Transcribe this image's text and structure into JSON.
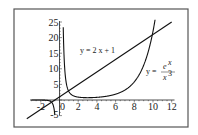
{
  "chart_data": {
    "type": "line",
    "title": "",
    "xlabel": "",
    "ylabel": "",
    "xlim": [
      -3,
      12
    ],
    "ylim": [
      -5,
      25
    ],
    "grid": false,
    "x_ticks": [
      -2,
      0,
      2,
      4,
      6,
      8,
      10,
      12
    ],
    "y_ticks": [
      -5,
      5,
      10,
      15,
      20,
      25
    ],
    "x_tick_labels": [
      "-2",
      "0",
      "2",
      "4",
      "6",
      "8",
      "10",
      "12"
    ],
    "y_tick_labels": [
      "-5",
      "5",
      "10",
      "15",
      "20",
      "25"
    ],
    "series": [
      {
        "name": "y = 2x + 1",
        "function": "2*x+1",
        "x": [
          -3,
          0,
          12
        ],
        "y": [
          -5,
          1,
          25
        ]
      },
      {
        "name": "y = e^x / x^3",
        "function": "exp(x)/x^3",
        "x": [
          -1,
          0.6,
          1,
          2,
          3,
          4,
          5,
          6,
          7,
          8,
          9,
          10
        ],
        "y": [
          -0.37,
          8.5,
          2.72,
          0.92,
          0.74,
          0.85,
          1.19,
          1.87,
          3.2,
          5.82,
          11.1,
          22.0
        ]
      }
    ],
    "annotations": [
      {
        "text": "y = 2 x + 1",
        "x": 5,
        "y": 17
      },
      {
        "text": "y = e^x / x^3",
        "x": 11,
        "y": 7
      }
    ],
    "intersections": [
      {
        "x": 0.9,
        "y": 2.8
      },
      {
        "x": 10.0,
        "y": 21.0
      }
    ]
  },
  "labels": {
    "line_eq": "y = 2 x + 1",
    "curve_eq_lhs": "y =",
    "curve_num": "e",
    "curve_num_exp": "x",
    "curve_den": "x",
    "curve_den_exp": "3"
  }
}
